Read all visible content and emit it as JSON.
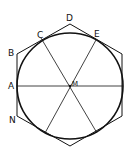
{
  "diagram": {
    "title": "",
    "labels": {
      "A": "A",
      "B": "B",
      "C": "C",
      "D": "D",
      "E": "E",
      "M": "M",
      "N": "N"
    },
    "colors": {
      "stroke": "#111111",
      "background": "#ffffff"
    }
  }
}
